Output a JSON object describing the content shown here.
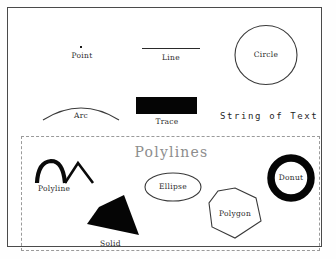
{
  "canvas": {
    "width": 336,
    "height": 259,
    "background": "#ffffff",
    "frame_color": "#4a4a4a"
  },
  "top_section": {
    "name": "primitive-shapes",
    "items": [
      {
        "key": "point",
        "label": "Point",
        "shape": "point-dot",
        "stroke": "#1a1a1a",
        "fill": "none"
      },
      {
        "key": "line",
        "label": "Line",
        "shape": "line-segment",
        "stroke": "#2a2a2a",
        "fill": "none"
      },
      {
        "key": "circle",
        "label": "Circle",
        "shape": "circle-outline",
        "stroke": "#3a3a3a",
        "fill": "none"
      },
      {
        "key": "arc",
        "label": "Arc",
        "shape": "arc-curve",
        "stroke": "#3a3a3a",
        "fill": "none"
      },
      {
        "key": "trace",
        "label": "Trace",
        "shape": "filled-rectangle",
        "stroke": "none",
        "fill": "#050505"
      },
      {
        "key": "text",
        "label": "String of Text",
        "shape": "text-string",
        "stroke": "none",
        "fill": "#1f1f1f"
      }
    ]
  },
  "polylines_section": {
    "title": "Polylines",
    "title_color": "#8d8d8d",
    "border_style": "dashed",
    "border_color": "#9a9a9a",
    "items": [
      {
        "key": "polyline",
        "label": "Polyline",
        "shape": "polyline-stroke",
        "stroke": "#0a0a0a",
        "fill": "none"
      },
      {
        "key": "ellipse",
        "label": "Ellipse",
        "shape": "ellipse-outline",
        "stroke": "#3a3a3a",
        "fill": "none"
      },
      {
        "key": "donut",
        "label": "Donut",
        "shape": "ring",
        "stroke": "#050505",
        "fill": "none"
      },
      {
        "key": "solid",
        "label": "Solid",
        "shape": "filled-polygon",
        "stroke": "none",
        "fill": "#050505"
      },
      {
        "key": "polygon",
        "label": "Polygon",
        "shape": "heptagon-outline",
        "stroke": "#3a3a3a",
        "fill": "none"
      }
    ]
  }
}
